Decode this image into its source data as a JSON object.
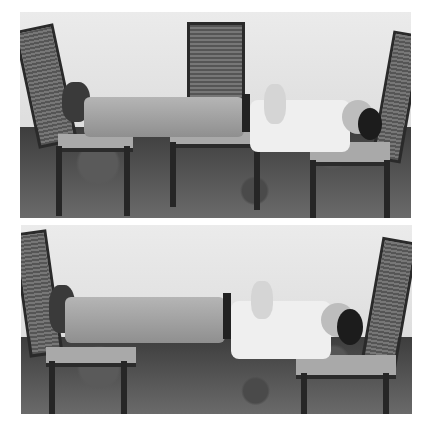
{
  "image": {
    "description": "Two black-and-white photographs stacked vertically showing a man lying rigidly suspended across chairs",
    "panels": [
      {
        "position": "top",
        "caption": "",
        "scene": "man lying horizontally across three chairs: feet on left chair, body over middle chair, head on right chair"
      },
      {
        "position": "bottom",
        "caption": "",
        "scene": "man lying horizontally bridged between two chairs with middle chair removed: feet on left chair, head/shoulders on right chair"
      }
    ]
  }
}
